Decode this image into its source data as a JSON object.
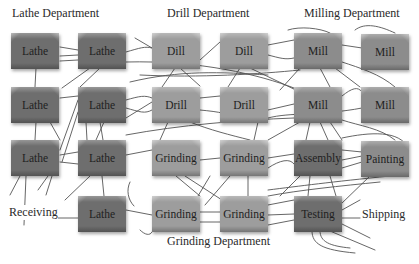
{
  "diagram": {
    "type": "functional-layout-flow-diagram",
    "department_labels": {
      "lathe": "Lathe Department",
      "drill": "Drill Department",
      "milling": "Milling Department",
      "grinding": "Grinding Department"
    },
    "area_labels": {
      "receiving": "Receiving",
      "shipping": "Shipping"
    },
    "machines": [
      {
        "id": "lathe-1",
        "label": "Lathe",
        "department": "Lathe",
        "row": 1,
        "col": 1
      },
      {
        "id": "lathe-2",
        "label": "Lathe",
        "department": "Lathe",
        "row": 1,
        "col": 2
      },
      {
        "id": "dill-1",
        "label": "Dill",
        "department": "Drill",
        "row": 1,
        "col": 3
      },
      {
        "id": "dill-2",
        "label": "Dill",
        "department": "Drill",
        "row": 1,
        "col": 4
      },
      {
        "id": "mill-1",
        "label": "Mill",
        "department": "Milling",
        "row": 1,
        "col": 5
      },
      {
        "id": "mill-2",
        "label": "Mill",
        "department": "Milling",
        "row": 1,
        "col": 6
      },
      {
        "id": "lathe-3",
        "label": "Lathe",
        "department": "Lathe",
        "row": 2,
        "col": 1
      },
      {
        "id": "lathe-4",
        "label": "Lathe",
        "department": "Lathe",
        "row": 2,
        "col": 2
      },
      {
        "id": "drill-1",
        "label": "Drill",
        "department": "Drill",
        "row": 2,
        "col": 3
      },
      {
        "id": "drill-2",
        "label": "Drill",
        "department": "Drill",
        "row": 2,
        "col": 4
      },
      {
        "id": "mill-3",
        "label": "Mill",
        "department": "Milling",
        "row": 2,
        "col": 5
      },
      {
        "id": "mill-4",
        "label": "Mill",
        "department": "Milling",
        "row": 2,
        "col": 6
      },
      {
        "id": "lathe-5",
        "label": "Lathe",
        "department": "Lathe",
        "row": 3,
        "col": 1
      },
      {
        "id": "lathe-6",
        "label": "Lathe",
        "department": "Lathe",
        "row": 3,
        "col": 2
      },
      {
        "id": "grinding-1",
        "label": "Grinding",
        "department": "Grinding",
        "row": 3,
        "col": 3
      },
      {
        "id": "grinding-2",
        "label": "Grinding",
        "department": "Grinding",
        "row": 3,
        "col": 4
      },
      {
        "id": "assembly",
        "label": "Assembly",
        "department": "Assembly",
        "row": 3,
        "col": 5
      },
      {
        "id": "painting",
        "label": "Painting",
        "department": "Painting",
        "row": 3,
        "col": 6
      },
      {
        "id": "lathe-7",
        "label": "Lathe",
        "department": "Lathe",
        "row": 4,
        "col": 2
      },
      {
        "id": "grinding-3",
        "label": "Grinding",
        "department": "Grinding",
        "row": 4,
        "col": 3
      },
      {
        "id": "grinding-4",
        "label": "Grinding",
        "department": "Grinding",
        "row": 4,
        "col": 4
      },
      {
        "id": "testing",
        "label": "Testing",
        "department": "Testing",
        "row": 4,
        "col": 5
      }
    ],
    "colors": {
      "lathe_box": "#6e6e6e",
      "drill_grinding_box": "#9d9d9d",
      "mill_box": "#8c8c8c",
      "flow_lines": "#555555",
      "background": "#ffffff",
      "text": "#1e1e1e"
    }
  }
}
